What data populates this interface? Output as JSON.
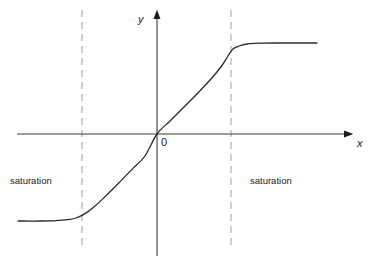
{
  "figure": {
    "title": "",
    "background_color": "#ffffff",
    "axis_color": "#3a3a3a",
    "curve_color": "#2b2b2b",
    "dashed_line_color": "#b0b0b0",
    "text_color": "#1a1a1a"
  },
  "labels": {
    "y_axis": "y",
    "x_axis": "x",
    "origin": "0",
    "saturation_left": "saturation",
    "saturation_right": "saturation"
  },
  "chart_data": {
    "type": "line",
    "title": "",
    "xlabel": "x",
    "ylabel": "y",
    "grid": false,
    "legend": null,
    "axes": {
      "x_axis_y_pixel": 134,
      "y_axis_x_pixel": 157,
      "x_axis_start_pixel": 17,
      "x_axis_end_pixel": 352,
      "y_axis_top_pixel": 10,
      "y_axis_bottom_pixel": 256,
      "arrowheads": [
        "x-positive",
        "y-positive"
      ]
    },
    "annotations": [
      {
        "text": "saturation",
        "region": "left",
        "x_pixel": 10,
        "y_pixel": 176
      },
      {
        "text": "saturation",
        "region": "right",
        "x_pixel": 250,
        "y_pixel": 176
      },
      {
        "text": "0",
        "region": "origin",
        "x_pixel": 161,
        "y_pixel": 137
      }
    ],
    "threshold_lines": [
      {
        "name": "left-threshold",
        "x_pixel": 82,
        "style": "dashed",
        "y_from_pixel": 10,
        "y_to_pixel": 247
      },
      {
        "name": "right-threshold",
        "x_pixel": 231,
        "style": "dashed",
        "y_from_pixel": 10,
        "y_to_pixel": 247
      }
    ],
    "series": [
      {
        "name": "transfer-curve",
        "points_pixel": [
          [
            18,
            221
          ],
          [
            40,
            221
          ],
          [
            56,
            220.6
          ],
          [
            68,
            219.6
          ],
          [
            76,
            218
          ],
          [
            82,
            215.4
          ],
          [
            88,
            211.6
          ],
          [
            95,
            206
          ],
          [
            103,
            198.6
          ],
          [
            112,
            189.8
          ],
          [
            122,
            179.6
          ],
          [
            133,
            168.4
          ],
          [
            145,
            156
          ],
          [
            157,
            134
          ],
          [
            170,
            121
          ],
          [
            182,
            109
          ],
          [
            194,
            97
          ],
          [
            205,
            85.5
          ],
          [
            214,
            75.5
          ],
          [
            222,
            65.5
          ],
          [
            228,
            56
          ],
          [
            233,
            49
          ],
          [
            239,
            46
          ],
          [
            247,
            44
          ],
          [
            260,
            43.2
          ],
          [
            280,
            43
          ],
          [
            317,
            43
          ]
        ],
        "plateau_low_y_pixel": 221,
        "plateau_high_y_pixel": 43,
        "linear_region_x_pixel": [
          82,
          231
        ]
      }
    ]
  }
}
